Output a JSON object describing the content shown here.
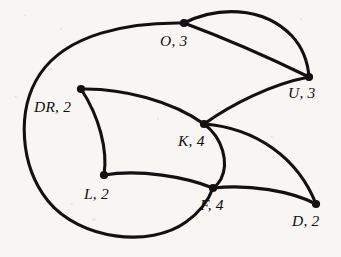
{
  "figure": {
    "type": "undirected-graph-diagram",
    "width": 341,
    "height": 257,
    "background_color": "#f7f6f3",
    "stroke_color": "#111111"
  },
  "vertices": [
    {
      "id": "O",
      "label": "O, 3",
      "name": "O",
      "degree": 3,
      "x": 184,
      "y": 23,
      "label_x": 160,
      "label_y": 33
    },
    {
      "id": "U",
      "label": "U, 3",
      "name": "U",
      "degree": 3,
      "x": 309,
      "y": 77,
      "label_x": 288,
      "label_y": 85
    },
    {
      "id": "DR",
      "label": "DR, 2",
      "name": "DR",
      "degree": 2,
      "x": 81,
      "y": 89,
      "label_x": 34,
      "label_y": 99
    },
    {
      "id": "K",
      "label": "K, 4",
      "name": "K",
      "degree": 4,
      "x": 204,
      "y": 124,
      "label_x": 178,
      "label_y": 133
    },
    {
      "id": "L",
      "label": "L, 2",
      "name": "L",
      "degree": 2,
      "x": 104,
      "y": 175,
      "label_x": 84,
      "label_y": 186
    },
    {
      "id": "F",
      "label": "F, 4",
      "name": "F",
      "degree": 4,
      "x": 213,
      "y": 188,
      "label_x": 200,
      "label_y": 197
    },
    {
      "id": "D",
      "label": "D, 2",
      "name": "D",
      "degree": 2,
      "x": 316,
      "y": 204,
      "label_x": 292,
      "label_y": 213
    }
  ],
  "edges": [
    {
      "id": "O-U-upper",
      "from": "O",
      "to": "U",
      "path": "M 184 23 C 216 7 262 5 292 36 C 303 48 308 64 309 77"
    },
    {
      "id": "O-U-lower",
      "from": "O",
      "to": "U",
      "path": "M 184 23 C 219 36 268 57 309 77"
    },
    {
      "id": "O-DR-F-outer",
      "from": "O",
      "to": "F",
      "path": "M 184 23 C 128 22 67 34 40 74 C 16 110 20 166 48 201 C 80 240 150 248 186 222 C 200 212 209 199 213 188"
    },
    {
      "id": "DR-K",
      "from": "DR",
      "to": "K",
      "path": "M 81 89 C 122 88 172 101 204 124"
    },
    {
      "id": "DR-L",
      "from": "DR",
      "to": "L",
      "path": "M 81 89 C 99 116 108 150 104 175"
    },
    {
      "id": "K-U",
      "from": "K",
      "to": "U",
      "path": "M 204 124 C 232 104 272 84 309 77"
    },
    {
      "id": "K-F",
      "from": "K",
      "to": "F",
      "path": "M 204 124 C 223 138 229 163 221 179 C 218 184 215 187 213 188"
    },
    {
      "id": "K-D",
      "from": "K",
      "to": "D",
      "path": "M 204 124 C 256 128 298 158 316 204"
    },
    {
      "id": "L-F",
      "from": "L",
      "to": "F",
      "path": "M 104 175 C 140 169 186 177 213 188"
    },
    {
      "id": "F-D",
      "from": "F",
      "to": "D",
      "path": "M 213 188 C 249 184 291 191 316 204"
    }
  ]
}
